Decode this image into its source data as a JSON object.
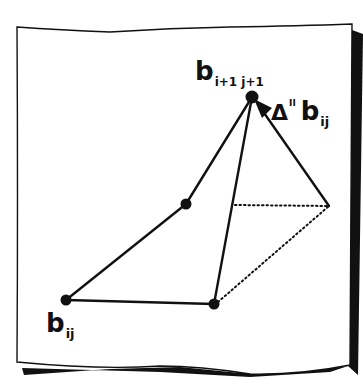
{
  "diagram": {
    "colors": {
      "ink": "#111111",
      "paper": "#ffffff",
      "shadow": "#111111"
    },
    "points": [
      {
        "id": "b_ij",
        "x": 66,
        "y": 300
      },
      {
        "id": "bottom_right",
        "x": 214,
        "y": 304
      },
      {
        "id": "mid_left",
        "x": 186,
        "y": 204
      },
      {
        "id": "b_i1_j1",
        "x": 252,
        "y": 97
      }
    ],
    "labels": {
      "b_ij": {
        "main": "b",
        "sub": "ij"
      },
      "b_apex": {
        "main": "b",
        "sub": "i+1 j+1"
      },
      "delta": {
        "main": "Δ",
        "sup": "II",
        "var": "b",
        "sub": "ij"
      }
    }
  }
}
